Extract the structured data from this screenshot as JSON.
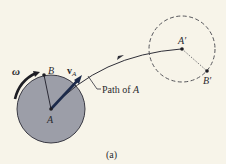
{
  "figure": {
    "caption": "(a)",
    "labels": {
      "omega": "ω",
      "point_b": "B",
      "velocity_symbol": "v",
      "velocity_subscript": "A",
      "point_a": "A",
      "path_prefix": "Path of ",
      "path_point": "A",
      "point_a_prime": "A′",
      "point_b_prime": "B′"
    },
    "colors": {
      "background": "#f7f4e9",
      "disc_fill": "#9c9ea8",
      "outline": "#2a2a35",
      "velocity_arrow": "#1c2a4a",
      "dashed_circle": "#55555a"
    }
  }
}
